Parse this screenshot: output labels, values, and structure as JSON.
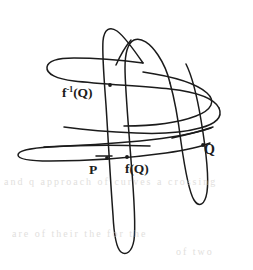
{
  "figure": {
    "background_color": "#ffffff",
    "ink_color": "#1b1b1b",
    "width": 253,
    "height": 270
  },
  "labels": {
    "f_inverse_Q": {
      "base": "f",
      "exponent": "-1",
      "arg": "(Q)",
      "plain": "f-1(Q)",
      "x": 62,
      "y": 86
    },
    "P": {
      "text": "P",
      "x": 89,
      "y": 163
    },
    "f_of_Q": {
      "text": "f(Q)",
      "x": 125,
      "y": 162
    },
    "Q": {
      "text": "Q",
      "x": 204,
      "y": 143
    }
  },
  "marked_points": [
    {
      "name": "f-inverse-Q-point",
      "x": 110,
      "y": 85
    },
    {
      "name": "P-point",
      "x": 107,
      "y": 158
    },
    {
      "name": "f-of-Q-point",
      "x": 127,
      "y": 157
    },
    {
      "name": "Q-point",
      "x": 203,
      "y": 145
    }
  ],
  "bleed_text": {
    "row_1": "and  q    approach  of  curves  a    crossing",
    "row_2": "are  of  their  the  for  the",
    "row_3": "of  two"
  }
}
